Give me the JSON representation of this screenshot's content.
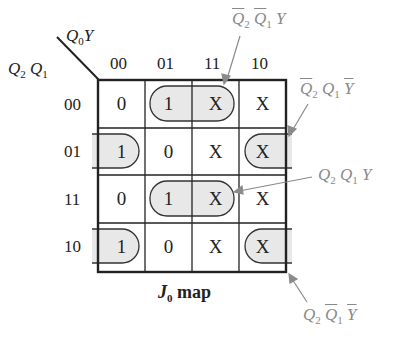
{
  "map": {
    "title_var": "J",
    "title_sub": "0",
    "title_suffix": " map",
    "column_var": "Q",
    "column_var_sub": "0",
    "column_var2": "Y",
    "row_var1": "Q",
    "row_var1_sub": "2",
    "row_var2": "Q",
    "row_var2_sub": "1",
    "column_headers": [
      "00",
      "01",
      "11",
      "10"
    ],
    "row_headers": [
      "00",
      "01",
      "11",
      "10"
    ],
    "cells": [
      [
        "0",
        "1",
        "X",
        "X"
      ],
      [
        "1",
        "0",
        "X",
        "X"
      ],
      [
        "0",
        "1",
        "X",
        "X"
      ],
      [
        "1",
        "0",
        "X",
        "X"
      ]
    ],
    "group_fill_color": "#e8e8e8",
    "annotation_color": "#8a8a8a"
  },
  "annotations": [
    {
      "id": "top",
      "terms": [
        {
          "v": "Q",
          "s": "2",
          "bar": true
        },
        {
          "v": "Q",
          "s": "1",
          "bar": true
        },
        {
          "v": "Y",
          "s": "",
          "bar": false
        }
      ]
    },
    {
      "id": "right-upper",
      "terms": [
        {
          "v": "Q",
          "s": "2",
          "bar": true
        },
        {
          "v": "Q",
          "s": "1",
          "bar": false
        },
        {
          "v": "Y",
          "s": "",
          "bar": true
        }
      ]
    },
    {
      "id": "right-middle",
      "terms": [
        {
          "v": "Q",
          "s": "2",
          "bar": false
        },
        {
          "v": "Q",
          "s": "1",
          "bar": false
        },
        {
          "v": "Y",
          "s": "",
          "bar": false
        }
      ]
    },
    {
      "id": "bottom",
      "terms": [
        {
          "v": "Q",
          "s": "2",
          "bar": false
        },
        {
          "v": "Q",
          "s": "1",
          "bar": true
        },
        {
          "v": "Y",
          "s": "",
          "bar": true
        }
      ]
    }
  ]
}
